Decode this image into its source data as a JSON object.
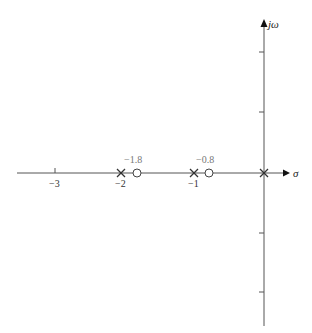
{
  "diagram": {
    "type": "pole-zero-plot",
    "axes": {
      "real_label": "σ",
      "imag_label": "jω",
      "real_ticks": [
        {
          "value": -3,
          "label": "−3"
        },
        {
          "value": -2,
          "label": "−2"
        },
        {
          "value": -1,
          "label": "−1"
        }
      ],
      "imag_ticks_count_each_side": 2
    },
    "poles": [
      {
        "value": 0,
        "marker": "x"
      },
      {
        "value": -1,
        "marker": "x"
      },
      {
        "value": -2,
        "marker": "x"
      }
    ],
    "zeros": [
      {
        "value": -0.8,
        "label": "−0.8",
        "marker": "o"
      },
      {
        "value": -1.8,
        "label": "−1.8",
        "marker": "o"
      }
    ],
    "colors": {
      "axis": "#555555",
      "marker": "#333333",
      "zero_label": "#777777"
    }
  }
}
